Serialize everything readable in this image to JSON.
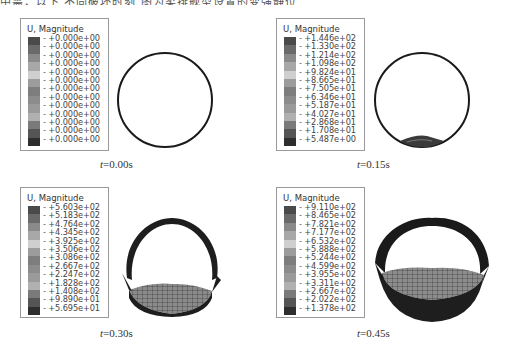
{
  "header": {
    "caption_fragment": "中需，以下 不同破坏时刻 图为柔排舰型设置的变强静位"
  },
  "panels": [
    {
      "legend_title": "U, Magnitude",
      "values": [
        "+0.000e+00",
        "+0.000e+00",
        "+0.000e+00",
        "+0.000e+00",
        "+0.000e+00",
        "+0.000e+00",
        "+0.000e+00",
        "+0.000e+00",
        "+0.000e+00",
        "+0.000e+00",
        "+0.000e+00",
        "+0.000e+00",
        "+0.000e+00"
      ],
      "time_var": "t",
      "time_value": "=0.00s"
    },
    {
      "legend_title": "U, Magnitude",
      "values": [
        "+1.446e+02",
        "+1.330e+02",
        "+1.214e+02",
        "+1.098e+02",
        "+9.824e+01",
        "+8.665e+01",
        "+7.505e+01",
        "+6.346e+01",
        "+5.187e+01",
        "+4.027e+01",
        "+2.868e+01",
        "+1.708e+01",
        "+5.487e+00"
      ],
      "time_var": "t",
      "time_value": "=0.15s"
    },
    {
      "legend_title": "U, Magnitude",
      "values": [
        "+5.603e+02",
        "+5.183e+02",
        "+4.764e+02",
        "+4.345e+02",
        "+3.925e+02",
        "+3.506e+02",
        "+3.086e+02",
        "+2.667e+02",
        "+2.247e+02",
        "+1.828e+02",
        "+1.408e+02",
        "+9.890e+01",
        "+5.695e+01"
      ],
      "time_var": "t",
      "time_value": "=0.30s"
    },
    {
      "legend_title": "U, Magnitude",
      "values": [
        "+9.110e+02",
        "+8.465e+02",
        "+7.821e+02",
        "+7.177e+02",
        "+6.532e+02",
        "+5.888e+02",
        "+5.244e+02",
        "+4.599e+02",
        "+3.955e+02",
        "+3.311e+02",
        "+2.667e+02",
        "+2.022e+02",
        "+1.378e+02"
      ],
      "time_var": "t",
      "time_value": "=0.45s"
    }
  ],
  "legend_colors": [
    "#4a4a4a",
    "#6a6a6a",
    "#8a8a8a",
    "#a8a8a8",
    "#cfcfcf",
    "#9c9c9c",
    "#7e7e7e",
    "#8c8c8c",
    "#9a9a9a",
    "#b0b0b0",
    "#7a7a7a",
    "#555555",
    "#2e2e2e"
  ]
}
